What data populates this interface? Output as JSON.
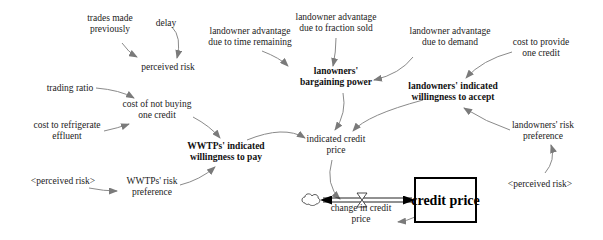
{
  "diagram": {
    "type": "stock-and-flow",
    "nodes": {
      "trades_made_previously": {
        "lines": [
          "trades made",
          "previously"
        ],
        "x": 110,
        "y": 23,
        "style": "normal"
      },
      "delay": {
        "lines": [
          "delay"
        ],
        "x": 166,
        "y": 23,
        "style": "normal"
      },
      "perceived_risk_top": {
        "lines": [
          "perceived risk"
        ],
        "x": 168,
        "y": 67,
        "style": "normal"
      },
      "landowner_adv_time": {
        "lines": [
          "landowner advantage",
          "due to time remaining"
        ],
        "x": 250,
        "y": 36,
        "style": "normal"
      },
      "landowner_adv_fraction": {
        "lines": [
          "landowner advantage",
          "due to fraction sold"
        ],
        "x": 336,
        "y": 22,
        "style": "normal"
      },
      "landowner_adv_demand": {
        "lines": [
          "landowner advantage",
          "due to demand"
        ],
        "x": 450,
        "y": 36,
        "style": "normal"
      },
      "lanowners_bargaining_power": {
        "lines": [
          "lanowners'",
          "bargaining power"
        ],
        "x": 336,
        "y": 76,
        "style": "bold"
      },
      "cost_to_provide": {
        "lines": [
          "cost to provide",
          "one credit"
        ],
        "x": 541,
        "y": 47,
        "style": "normal"
      },
      "landowners_willingness_accept": {
        "lines": [
          "landowners' indicated",
          "willingness to accept"
        ],
        "x": 453,
        "y": 91,
        "style": "bold"
      },
      "trading_ratio": {
        "lines": [
          "trading ratio"
        ],
        "x": 70,
        "y": 88,
        "style": "normal"
      },
      "cost_not_buying": {
        "lines": [
          "cost of not buying",
          "one credit"
        ],
        "x": 157,
        "y": 109,
        "style": "normal"
      },
      "cost_refrigerate": {
        "lines": [
          "cost to refrigerate",
          "effluent"
        ],
        "x": 67,
        "y": 130,
        "style": "normal"
      },
      "wwtps_willingness_pay": {
        "lines": [
          "WWTPs' indicated",
          "willingness to pay"
        ],
        "x": 226,
        "y": 151,
        "style": "bold"
      },
      "indicated_credit_price": {
        "lines": [
          "indicated credit",
          "price"
        ],
        "x": 336,
        "y": 144,
        "style": "normal"
      },
      "landowners_risk_pref": {
        "lines": [
          "landowners' risk",
          "preference"
        ],
        "x": 543,
        "y": 130,
        "style": "normal"
      },
      "perceived_risk_shadow_left": {
        "lines": [
          "<perceived risk>"
        ],
        "x": 63,
        "y": 181,
        "style": "shadow"
      },
      "wwtps_risk_pref": {
        "lines": [
          "WWTPs' risk",
          "preference"
        ],
        "x": 152,
        "y": 186,
        "style": "normal"
      },
      "perceived_risk_shadow_right": {
        "lines": [
          "<perceived risk>"
        ],
        "x": 540,
        "y": 184,
        "style": "shadow"
      },
      "change_in_credit_price": {
        "lines": [
          "change in credit",
          "price"
        ],
        "x": 361,
        "y": 213,
        "style": "normal"
      }
    },
    "stock": {
      "label": "credit price",
      "x": 415,
      "y": 178,
      "width": 61,
      "height": 44
    },
    "cloud": {
      "x": 313,
      "y": 200,
      "name": "source-sink-cloud"
    },
    "valve": {
      "x": 362,
      "y": 200
    },
    "links": [
      {
        "from": "trades_made_previously",
        "to": "perceived_risk_top",
        "d": "M 122 43 Q 128 52 137 57"
      },
      {
        "from": "delay",
        "to": "perceived_risk_top",
        "d": "M 172 27 Q 182 37 177 58"
      },
      {
        "from": "landowner_adv_time",
        "to": "lanowners_bargaining_power",
        "d": "M 262 51 Q 280 58 288 66"
      },
      {
        "from": "landowner_adv_fraction",
        "to": "lanowners_bargaining_power",
        "d": "M 336 38 Q 336 52 333 66"
      },
      {
        "from": "landowner_adv_demand",
        "to": "lanowners_bargaining_power",
        "d": "M 413 57 Q 400 74 374 80"
      },
      {
        "from": "cost_to_provide",
        "to": "landowners_willingness_accept",
        "d": "M 512 52 Q 482 60 466 78"
      },
      {
        "from": "lanowners_bargaining_power",
        "to": "indicated_credit_price",
        "d": "M 343 93 Q 347 113 335 130"
      },
      {
        "from": "landowners_willingness_accept",
        "to": "indicated_credit_price",
        "d": "M 423 100 Q 367 115 353 131"
      },
      {
        "from": "landowners_risk_pref",
        "to": "landowners_willingness_accept",
        "d": "M 510 130 Q 486 122 464 108"
      },
      {
        "from": "perceived_risk_shadow_right",
        "to": "landowners_risk_pref",
        "d": "M 545 173 Q 556 160 551 145"
      },
      {
        "from": "trading_ratio",
        "to": "cost_not_buying",
        "d": "M 96 88 Q 120 90 134 98"
      },
      {
        "from": "cost_refrigerate",
        "to": "cost_not_buying",
        "d": "M 104 131 Q 118 128 129 124"
      },
      {
        "from": "cost_not_buying",
        "to": "wwtps_willingness_pay",
        "d": "M 193 117 Q 210 126 220 138"
      },
      {
        "from": "perceived_risk_shadow_left",
        "to": "wwtps_risk_pref",
        "d": "M 89 188 Q 104 191 117 191"
      },
      {
        "from": "wwtps_risk_pref",
        "to": "wwtps_willingness_pay",
        "d": "M 180 185 Q 200 180 215 167"
      },
      {
        "from": "wwtps_willingness_pay",
        "to": "indicated_credit_price",
        "d": "M 247 140 Q 284 125 305 138"
      },
      {
        "from": "indicated_credit_price",
        "to": "change_in_credit_price",
        "d": "M 332 160 Q 325 185 340 199"
      },
      {
        "from": "stock",
        "to": "change_in_credit_price",
        "d": "M 415 217 Q 407 221 398 222"
      }
    ]
  }
}
